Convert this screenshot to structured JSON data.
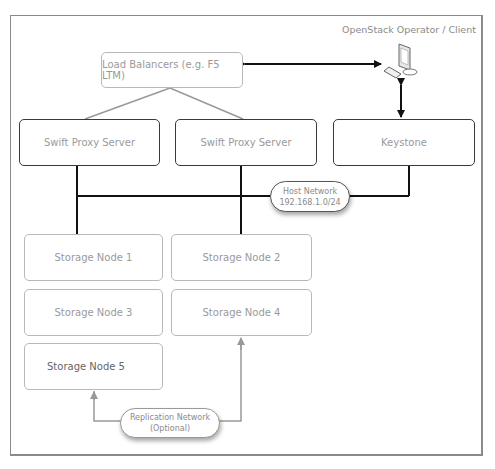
{
  "diagram": {
    "client_label": "OpenStack Operator / Client",
    "load_balancer": "Load Balancers (e.g. F5 LTM)",
    "proxies": [
      "Swift Proxy Server",
      "Swift Proxy Server"
    ],
    "keystone": "Keystone",
    "host_network": {
      "line1": "Host Network",
      "line2": "192.168.1.0/24"
    },
    "storage_nodes": [
      "Storage Node 1",
      "Storage Node 2",
      "Storage Node 3",
      "Storage Node 4",
      "Storage Node 5"
    ],
    "replication_network": {
      "line1": "Replication Network",
      "line2": "(Optional)"
    },
    "icons": {
      "client": "computer-icon"
    },
    "colors": {
      "dark_line": "#111111",
      "gray_line": "#999999",
      "text": "#9a9a9a"
    }
  }
}
